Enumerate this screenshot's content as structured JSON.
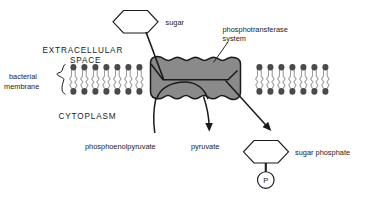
{
  "diagram": {
    "colors": {
      "protein_fill": "#8a8a8a",
      "protein_stroke": "#1a1a1a",
      "lipid_head": "#4a4a4a",
      "lipid_tail": "#9a9a9a",
      "line": "#1a1a1a",
      "text": "#1a1a1a",
      "background": "#ffffff"
    },
    "labels": {
      "sugar": "sugar",
      "phosphotransferase_system": "phosphotransferase",
      "phosphotransferase_system_line2": "system",
      "extracellular_space": "EXTRACELLULAR",
      "extracellular_space_line2": "SPACE",
      "bacterial_membrane": "bacterial",
      "bacterial_membrane_line2": "membrane",
      "cytoplasm": "CYTOPLASM",
      "phosphoenolpyruvate": "phosphoenolpyruvate",
      "pyruvate": "pyruvate",
      "sugar_phosphate": "sugar phosphate",
      "phosphate_group": "P"
    }
  }
}
